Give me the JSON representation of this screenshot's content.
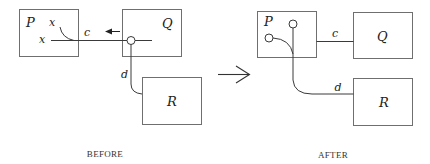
{
  "before": {
    "caption": "BEFORE",
    "nodes": {
      "P": {
        "label": "P"
      },
      "Q": {
        "label": "Q"
      },
      "R": {
        "label": "R"
      }
    },
    "port_labels": {
      "x_top": "x",
      "x_left": "x"
    },
    "channels": {
      "c": "c",
      "d": "d"
    }
  },
  "transition": {
    "icon": "right-arrow-icon"
  },
  "after": {
    "caption": "AFTER",
    "nodes": {
      "P": {
        "label": "P"
      },
      "Q": {
        "label": "Q"
      },
      "R": {
        "label": "R"
      }
    },
    "channels": {
      "c": "c",
      "d": "d"
    }
  },
  "colors": {
    "box_stroke": "#6f6f6f",
    "wire": "#3a3a3a",
    "text": "#222222"
  }
}
